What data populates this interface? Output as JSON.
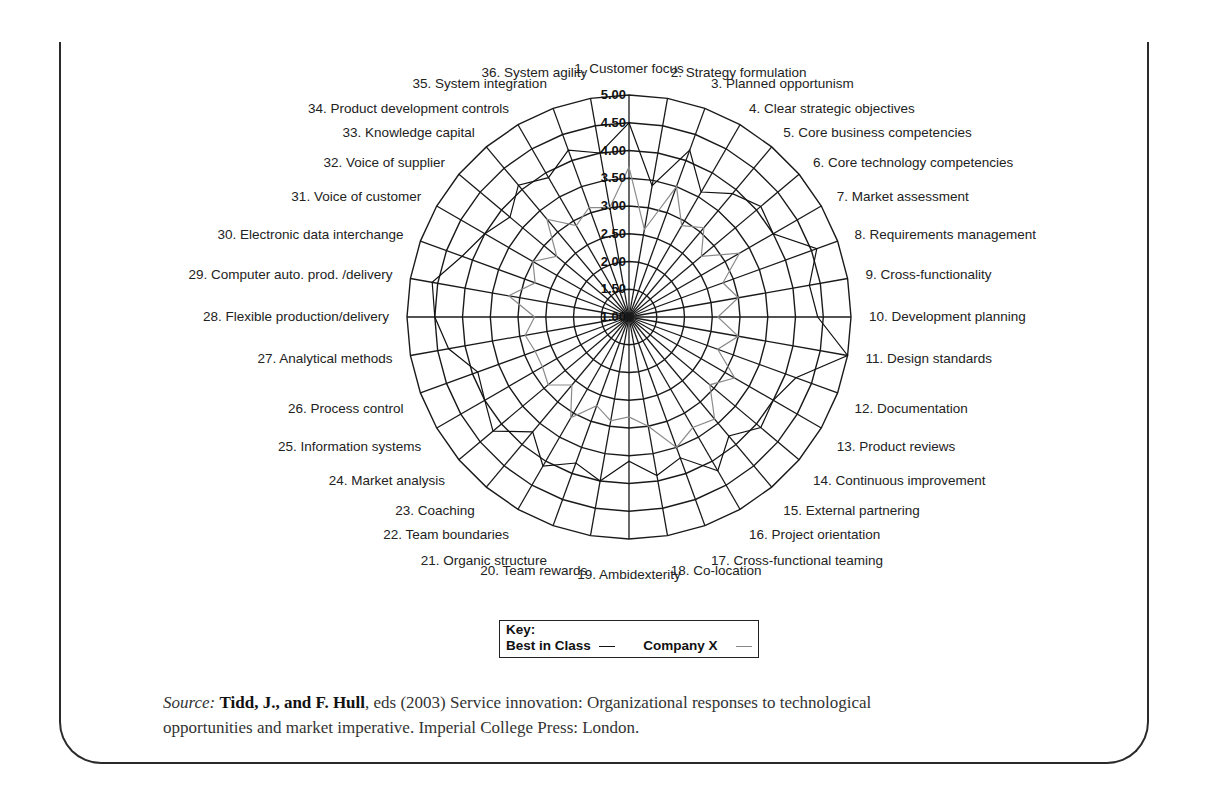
{
  "chart_data": {
    "type": "radar",
    "title": "",
    "axes": [
      "1. Customer focus",
      "2. Strategy formulation",
      "3. Planned opportunism",
      "4. Clear strategic objectives",
      "5. Core business competencies",
      "6. Core technology competencies",
      "7. Market assessment",
      "8. Requirements management",
      "9. Cross-functionality",
      "10. Development planning",
      "11. Design standards",
      "12. Documentation",
      "13. Product reviews",
      "14. Continuous improvement",
      "15. External partnering",
      "16. Project orientation",
      "17. Cross-functional teaming",
      "18. Co-location",
      "19. Ambidexterity",
      "20. Team rewards",
      "21. Organic structure",
      "22. Team boundaries",
      "23. Coaching",
      "24. Market analysis",
      "25. Information systems",
      "26. Process control",
      "27. Analytical methods",
      "28. Flexible production/delivery",
      "29. Computer auto. prod. /delivery",
      "30. Electronic data interchange",
      "31. Voice of customer",
      "32. Voice of supplier",
      "33. Knowledge capital",
      "34. Product development controls",
      "35. System integration",
      "36. System agility"
    ],
    "ring_ticks": [
      "1.00",
      "1.50",
      "2.00",
      "2.50",
      "3.00",
      "3.50",
      "4.00",
      "4.50",
      "5.00"
    ],
    "rmin": 1.0,
    "rmax": 5.0,
    "grid": true,
    "series": [
      {
        "name": "Best in Class",
        "color": "#111111",
        "values": [
          4.5,
          3.4,
          4.2,
          3.6,
          3.9,
          4.1,
          4.0,
          4.6,
          4.3,
          4.4,
          5.0,
          4.2,
          4.0,
          4.1,
          3.8,
          4.2,
          3.7,
          3.9,
          3.6,
          4.0,
          3.8,
          4.1,
          3.7,
          4.2,
          4.0,
          3.9,
          4.3,
          4.5,
          4.6,
          4.2,
          4.0,
          3.8,
          4.1,
          3.9,
          4.2,
          4.0
        ]
      },
      {
        "name": "Company X",
        "color": "#8a8a8a",
        "values": [
          3.7,
          2.6,
          3.5,
          2.9,
          3.1,
          2.7,
          3.3,
          2.8,
          3.0,
          2.6,
          3.0,
          2.7,
          3.2,
          2.9,
          3.4,
          3.3,
          3.5,
          3.0,
          2.8,
          2.9,
          2.7,
          3.1,
          2.6,
          2.9,
          2.8,
          2.8,
          2.9,
          2.7,
          3.2,
          2.8,
          3.0,
          2.7,
          3.3,
          2.9,
          3.1,
          3.0
        ]
      }
    ],
    "legend": {
      "title": "Key:",
      "entries": [
        "Best in Class",
        "Company X"
      ],
      "position": "below"
    }
  },
  "source": {
    "prefix": "Source:",
    "authors": "Tidd, J., and F. Hull",
    "rest_line1": ", eds (2003) Service innovation: Organizational responses to technological",
    "line2": "opportunities and market imperative. Imperial College Press: London."
  }
}
